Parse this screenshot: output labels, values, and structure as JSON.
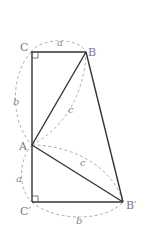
{
  "diagram": {
    "type": "geometry-right-triangles",
    "points": {
      "C": {
        "label": "C",
        "x": 31,
        "y": 52
      },
      "B": {
        "label": "B",
        "x": 86,
        "y": 52
      },
      "A": {
        "label": "A",
        "x": 32,
        "y": 145
      },
      "C_prime": {
        "label": "C′",
        "x": 32,
        "y": 202
      },
      "B_prime": {
        "label": "B′",
        "x": 123,
        "y": 202
      }
    },
    "lengths": {
      "CB": "a",
      "CA": "b",
      "AB": "c",
      "AC_prime": "a",
      "C_primeB_prime": "b",
      "AB_prime": "c"
    },
    "right_angles": [
      "C",
      "C′"
    ],
    "colors": {
      "solid": "#333333",
      "dashed": "#a8a8a8",
      "label": "#777777"
    }
  }
}
